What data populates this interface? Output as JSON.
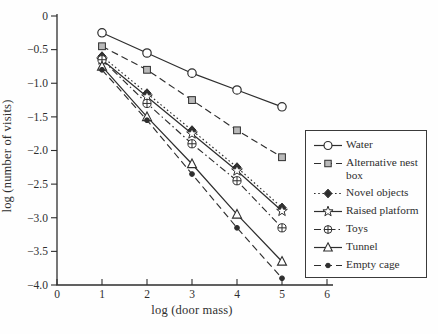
{
  "figure": {
    "background": "#fefefe",
    "ink": "#2e2e2e",
    "square_fill": "#b9b9b9"
  },
  "chart_data": {
    "type": "line",
    "title": "",
    "xlabel": "log (door mass)",
    "ylabel": "log (number of visits)",
    "xlim": [
      0,
      6
    ],
    "ylim": [
      -4.0,
      0
    ],
    "grid": false,
    "legend_position": "right",
    "xticks": [
      0,
      1,
      2,
      3,
      4,
      5,
      6
    ],
    "xtick_labels": [
      "0",
      "1",
      "2",
      "3",
      "4",
      "5",
      "6"
    ],
    "yticks": [
      0,
      -0.5,
      -1.0,
      -1.5,
      -2.0,
      -2.5,
      -3.0,
      -3.5,
      -4.0
    ],
    "ytick_labels": [
      "0",
      "−0.5",
      "−1.0",
      "−1.5",
      "−2.0",
      "−2.5",
      "−3.0",
      "−3.5",
      "−4.0"
    ],
    "x": [
      1,
      2,
      3,
      4,
      5
    ],
    "series": [
      {
        "name": "Water",
        "marker": "circle-open",
        "line": "solid",
        "values": [
          -0.25,
          -0.55,
          -0.85,
          -1.1,
          -1.35
        ]
      },
      {
        "name": "Alternative nest box",
        "marker": "square-gray",
        "line": "dashed",
        "values": [
          -0.45,
          -0.8,
          -1.25,
          -1.7,
          -2.1
        ]
      },
      {
        "name": "Novel objects",
        "marker": "diamond-filled",
        "line": "dotted",
        "values": [
          -0.6,
          -1.15,
          -1.7,
          -2.25,
          -2.85
        ]
      },
      {
        "name": "Raised platform",
        "marker": "star-open",
        "line": "solid",
        "values": [
          -0.65,
          -1.2,
          -1.75,
          -2.3,
          -2.9
        ]
      },
      {
        "name": "Toys",
        "marker": "circle-plus",
        "line": "dashdot",
        "values": [
          -0.65,
          -1.3,
          -1.9,
          -2.45,
          -3.15
        ]
      },
      {
        "name": "Tunnel",
        "marker": "triangle-open",
        "line": "solid",
        "values": [
          -0.75,
          -1.5,
          -2.2,
          -2.95,
          -3.65
        ]
      },
      {
        "name": "Empty cage",
        "marker": "dot-filled",
        "line": "dashed",
        "values": [
          -0.8,
          -1.55,
          -2.35,
          -3.15,
          -3.9
        ]
      }
    ]
  }
}
